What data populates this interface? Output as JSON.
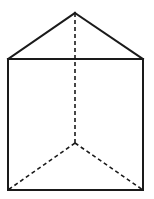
{
  "diagram": {
    "colors": {
      "stroke": "#1a1a1a",
      "background": "#ffffff"
    },
    "vertices": {
      "apex_top": [
        75,
        13
      ],
      "top_left": [
        8,
        59
      ],
      "top_right": [
        143,
        59
      ],
      "bottom_left": [
        8,
        190
      ],
      "bottom_right": [
        143,
        190
      ],
      "back_bottom": [
        75,
        143
      ]
    },
    "edges_solid": [
      [
        "top_left",
        "apex_top"
      ],
      [
        "apex_top",
        "top_right"
      ],
      [
        "top_left",
        "top_right"
      ],
      [
        "top_left",
        "bottom_left"
      ],
      [
        "top_right",
        "bottom_right"
      ],
      [
        "bottom_left",
        "bottom_right"
      ]
    ],
    "edges_dashed": [
      [
        "apex_top",
        "back_bottom"
      ],
      [
        "back_bottom",
        "bottom_left"
      ],
      [
        "back_bottom",
        "bottom_right"
      ]
    ]
  }
}
